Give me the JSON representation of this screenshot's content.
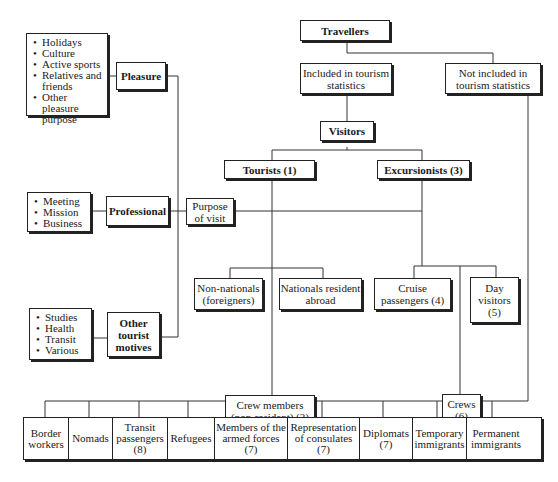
{
  "diagram": {
    "root": {
      "label": "Travellers"
    },
    "included": {
      "label": "Included in tourism statistics"
    },
    "not_included": {
      "label": "Not included in tourism statistics"
    },
    "visitors": {
      "label": "Visitors"
    },
    "tourists": {
      "label": "Tourists (1)"
    },
    "excursionists": {
      "label": "Excursionists (3)"
    },
    "purpose_of_visit": {
      "label": "Purpose of visit"
    },
    "purposes": [
      {
        "label": "Pleasure",
        "items": [
          "Holidays",
          "Culture",
          "Active sports",
          "Relatives and friends",
          "Other pleasure purpose"
        ]
      },
      {
        "label": "Professional",
        "items": [
          "Meeting",
          "Mission",
          "Business"
        ]
      },
      {
        "label": "Other tourist motives",
        "items": [
          "Studies",
          "Health",
          "Transit",
          "Various"
        ]
      }
    ],
    "tourist_children": [
      {
        "label": "Non-nationals (foreigners)"
      },
      {
        "label": "Nationals resident abroad"
      },
      {
        "label": "Crew members (non-resident) (2)"
      }
    ],
    "excursionist_children": [
      {
        "label": "Cruise passengers (4)"
      },
      {
        "label": "Day visitors (5)"
      },
      {
        "label": "Crews (6)"
      }
    ],
    "not_included_children": [
      {
        "label": "Border workers"
      },
      {
        "label": "Nomads"
      },
      {
        "label": "Transit passengers (8)"
      },
      {
        "label": "Refugees"
      },
      {
        "label": "Members of the armed forces (7)"
      },
      {
        "label": "Representation of consulates (7)"
      },
      {
        "label": "Diplomats (7)"
      },
      {
        "label": "Temporary immigrants"
      },
      {
        "label": "Permanent immigrants"
      }
    ]
  }
}
